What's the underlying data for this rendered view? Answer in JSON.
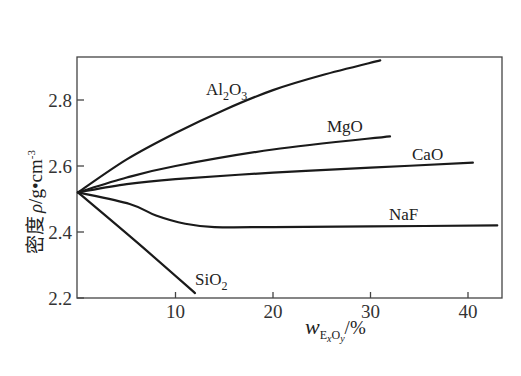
{
  "chart_data": {
    "type": "line",
    "title": "",
    "xlabel": {
      "base": "w",
      "sub_E": "E",
      "sub_x": "x",
      "sub_O": "O",
      "sub_y": "y",
      "unit": "/%"
    },
    "ylabel": {
      "text": "密度",
      "symbol": "ρ",
      "unit": "/g•cm",
      "exp": "-3"
    },
    "xlim": [
      0,
      44
    ],
    "ylim": [
      2.2,
      2.92
    ],
    "x_ticks": [
      10,
      20,
      30,
      40
    ],
    "x_tick_labels": [
      "10",
      "20",
      "30",
      "40"
    ],
    "y_ticks": [
      2.2,
      2.4,
      2.6,
      2.8
    ],
    "y_tick_labels": [
      "2.2",
      "2.4",
      "2.6",
      "2.8"
    ],
    "grid": false,
    "legend": "inline labels",
    "series": [
      {
        "name": "Al2O3",
        "label_main": "Al",
        "label_sub1": "2",
        "label_mid": "O",
        "label_sub2": "3",
        "x": [
          0,
          5,
          10,
          15,
          20,
          25,
          31
        ],
        "y": [
          2.52,
          2.62,
          2.7,
          2.77,
          2.83,
          2.875,
          2.92
        ]
      },
      {
        "name": "MgO",
        "label_main": "MgO",
        "x": [
          0,
          5,
          10,
          20,
          32
        ],
        "y": [
          2.52,
          2.565,
          2.6,
          2.65,
          2.69
        ]
      },
      {
        "name": "CaO",
        "label_main": "CaO",
        "x": [
          0,
          5,
          10,
          20,
          30,
          40.5
        ],
        "y": [
          2.52,
          2.545,
          2.56,
          2.58,
          2.595,
          2.61
        ]
      },
      {
        "name": "NaF",
        "label_main": "NaF",
        "x": [
          0,
          5.3,
          8,
          11,
          14,
          20,
          30,
          43
        ],
        "y": [
          2.52,
          2.485,
          2.45,
          2.425,
          2.415,
          2.415,
          2.417,
          2.42
        ]
      },
      {
        "name": "SiO2",
        "label_main": "SiO",
        "label_sub1": "2",
        "x": [
          0,
          6,
          12
        ],
        "y": [
          2.52,
          2.37,
          2.215
        ]
      }
    ]
  }
}
